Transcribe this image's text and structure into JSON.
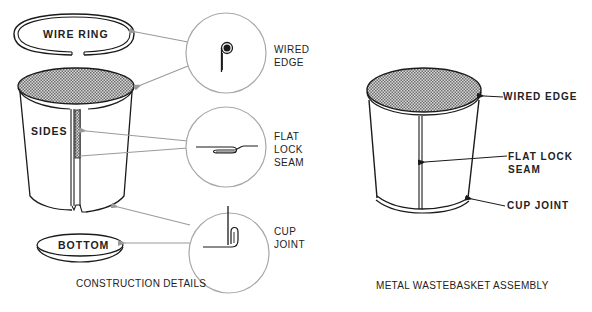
{
  "figure": {
    "left_panel": {
      "caption": "CONSTRUCTION DETAILS",
      "parts": {
        "wire_ring": "WIRE RING",
        "sides": "SIDES",
        "bottom": "BOTTOM"
      },
      "details": [
        {
          "id": "wired-edge",
          "label_line1": "WIRED",
          "label_line2": "EDGE",
          "label_line3": ""
        },
        {
          "id": "flat-lock-seam",
          "label_line1": "FLAT",
          "label_line2": "LOCK",
          "label_line3": "SEAM"
        },
        {
          "id": "cup-joint",
          "label_line1": "CUP",
          "label_line2": "JOINT",
          "label_line3": ""
        }
      ]
    },
    "right_panel": {
      "caption": "METAL WASTEBASKET ASSEMBLY",
      "callouts": {
        "wired_edge": "WIRED EDGE",
        "flat_lock_seam_line1": "FLAT LOCK",
        "flat_lock_seam_line2": "SEAM",
        "cup_joint": "CUP JOINT"
      }
    }
  },
  "colors": {
    "line": "#1a1a1a",
    "leader": "#9a9a9a",
    "circle": "#a8a8a8",
    "hatch": "#8c8c8c"
  }
}
